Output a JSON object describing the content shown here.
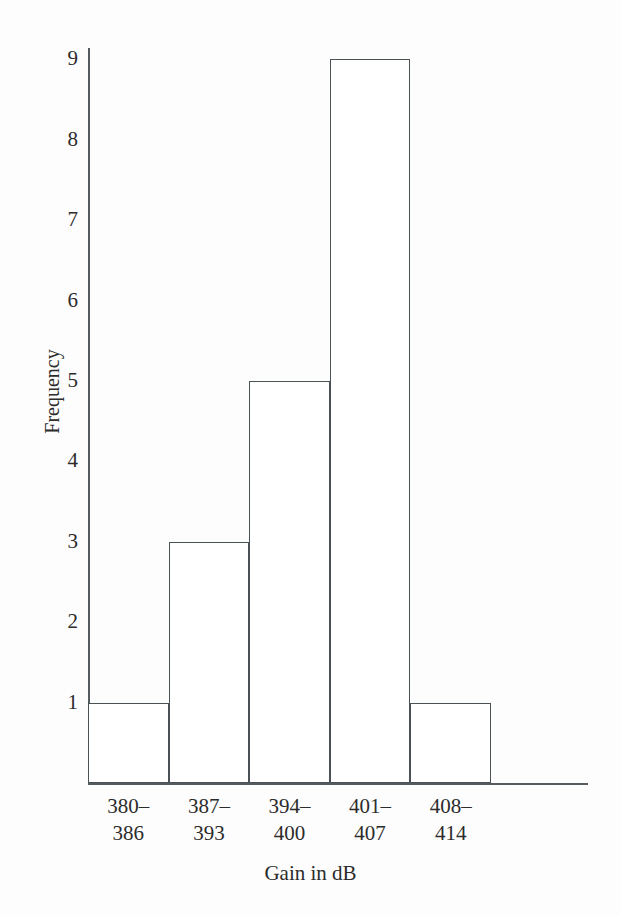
{
  "chart_data": {
    "type": "bar",
    "title": "",
    "subtitle": "",
    "xlabel": "Gain in dB",
    "ylabel": "Frequency",
    "categories": [
      "380–386",
      "387–393",
      "394–400",
      "401–407",
      "408–414"
    ],
    "category_lines": [
      [
        "380–",
        "386"
      ],
      [
        "387–",
        "393"
      ],
      [
        "394–",
        "400"
      ],
      [
        "401–",
        "407"
      ],
      [
        "408–",
        "414"
      ]
    ],
    "values": [
      1,
      3,
      5,
      9,
      1
    ],
    "ylim": [
      0,
      9
    ],
    "xlim": [
      0,
      5
    ],
    "y_ticks": [
      1,
      2,
      3,
      4,
      5,
      6,
      7,
      8,
      9
    ],
    "y_tick_labels": [
      "1",
      "2",
      "3",
      "4",
      "5",
      "6",
      "7",
      "8",
      "9"
    ],
    "grid": false,
    "legend": false,
    "legend_position": "none",
    "bar_fill_color": "#ffffff",
    "bar_edge_color": "#4b5256",
    "axis_color": "#555c60",
    "text_color": "#2c2c2c",
    "background_color": "#fdfdfd"
  },
  "layout": {
    "plot_left_px": 88,
    "plot_bottom_px": 783,
    "unit_height_px": 80.4,
    "bar_width_px": 80.6,
    "axis_right_px": 588
  }
}
